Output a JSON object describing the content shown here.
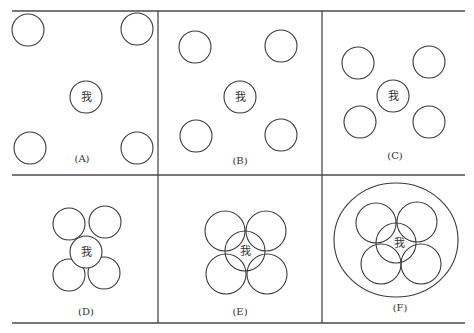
{
  "diagram": {
    "center_char": "我",
    "panels": [
      {
        "id": "A",
        "label": "(A)"
      },
      {
        "id": "B",
        "label": "(B)"
      },
      {
        "id": "C",
        "label": "(C)"
      },
      {
        "id": "D",
        "label": "(D)"
      },
      {
        "id": "E",
        "label": "(E)"
      },
      {
        "id": "F",
        "label": "(F)"
      }
    ],
    "colors": {
      "stroke": "#3a3a3a",
      "background": "#ffffff"
    }
  }
}
